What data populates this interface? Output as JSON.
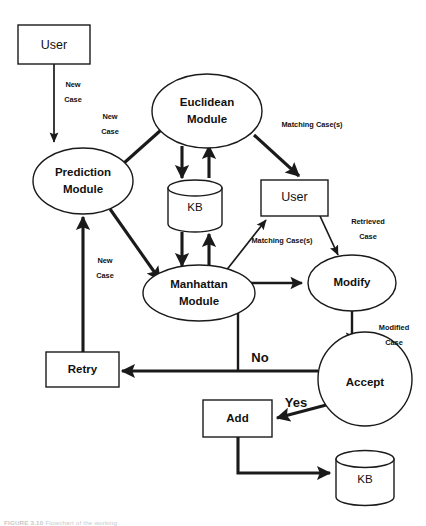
{
  "figure": {
    "caption_label": "FIGURE 3.10",
    "caption_text": "Flowchart of the working."
  },
  "nodes": {
    "user_top": {
      "label": "User",
      "shape": "rectangle"
    },
    "prediction_module": {
      "label_line1": "Prediction",
      "label_line2": "Module",
      "shape": "ellipse"
    },
    "euclidean_module": {
      "label_line1": "Euclidean",
      "label_line2": "Module",
      "shape": "ellipse"
    },
    "manhattan_module": {
      "label_line1": "Manhattan",
      "label_line2": "Module",
      "shape": "ellipse"
    },
    "kb_top": {
      "label": "KB",
      "shape": "cylinder"
    },
    "user_right": {
      "label": "User",
      "shape": "rectangle"
    },
    "modify": {
      "label": "Modify",
      "shape": "ellipse"
    },
    "accept": {
      "label": "Accept",
      "shape": "circle"
    },
    "retry": {
      "label": "Retry",
      "shape": "rectangle"
    },
    "add": {
      "label": "Add",
      "shape": "rectangle"
    },
    "kb_bottom": {
      "label": "KB",
      "shape": "cylinder"
    }
  },
  "edge_labels": {
    "user_to_prediction": {
      "line1": "New",
      "line2": "Case"
    },
    "prediction_to_euclidean": {
      "line1": "New",
      "line2": "Case"
    },
    "prediction_to_manhattan": {
      "line1": "New",
      "line2": "Case"
    },
    "retry_to_prediction": {
      "line1": "New",
      "line2": "Case"
    },
    "euclidean_to_user": {
      "line1": "Matching Case(s)"
    },
    "manhattan_to_user": {
      "line1": "Matching Case(s)"
    },
    "user_to_modify": {
      "line1": "Retrieved",
      "line2": "Case"
    },
    "modify_to_accept": {
      "line1": "Modified",
      "line2": "Case"
    },
    "accept_to_retry": {
      "line1": "No"
    },
    "accept_to_add": {
      "line1": "Yes"
    }
  },
  "colors": {
    "stroke": "#1a1a1a",
    "fill": "#ffffff",
    "text": "#111111",
    "caption": "#c9c9c9"
  }
}
